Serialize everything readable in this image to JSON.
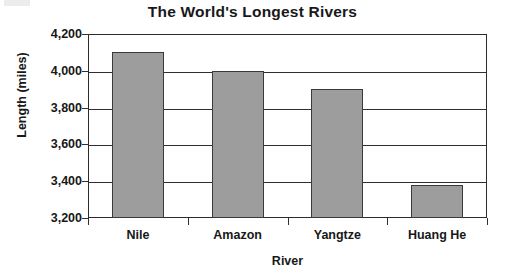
{
  "chart_data": {
    "type": "bar",
    "title": "The World's Longest Rivers",
    "xlabel": "River",
    "ylabel": "Length (miles)",
    "categories": [
      "Nile",
      "Amazon",
      "Yangtze",
      "Huang He"
    ],
    "values": [
      4100,
      4000,
      3900,
      3380
    ],
    "ylim": [
      3200,
      4200
    ],
    "ytick_step": 200,
    "yticks": [
      4200,
      4000,
      3800,
      3600,
      3400,
      3200
    ],
    "ytick_labels": [
      "4,200",
      "4,000",
      "3,800",
      "3,600",
      "3,400",
      "3,200"
    ],
    "grid": true,
    "legend": false,
    "bar_color": "#9d9d9d",
    "bar_border_color": "#3a3a3a",
    "axis_color": "#2f2f2f"
  }
}
